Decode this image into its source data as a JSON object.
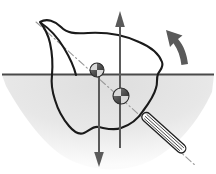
{
  "diagram": {
    "background_color": "#ffffff",
    "width": 216,
    "height": 174,
    "colors": {
      "hull_stroke": "#1a1a1a",
      "waterline_stroke": "#4a4a4a",
      "axis_stroke": "#9a9a9a",
      "force_arrow": "#5a5a5a",
      "water_fill": "#e8e8e8",
      "marker_dark": "#4f4f4f",
      "marker_light": "#d8d8d8",
      "rod_fill": "#fdfdfd",
      "rod_stroke": "#1f1f1f"
    },
    "elements": {
      "hull": {
        "name": "hull-cross-section",
        "description": "heeled ship hull cross-section outline with pointed bow at upper left and wavy keel bottom",
        "path": "M 40 22 C 46 18 54 20 60 26 C 66 32 72 33 86 32 C 104 31 122 34 138 41 C 150 46 158 53 161 61 C 163 66 160 70 158 74 C 156 78 157 82 156 87 C 154 95 149 102 143 110 C 137 118 129 124 120 127 C 112 130 104 128 97 127 C 92 126 88 130 83 132 C 78 134 73 131 68 125 C 62 118 57 109 54 99 C 51 90 50 82 51 74 C 52 63 52 52 50 43 C 48 34 44 27 40 22 Z"
      },
      "waterline": {
        "name": "waterline",
        "description": "horizontal free-surface line across full width",
        "y": 74,
        "x_start": 2,
        "x_end": 214
      },
      "water_region": {
        "name": "submerged-water-shading",
        "description": "light gray shaded region below the waterline tapering to a bowl shape",
        "fill": "#e8e8e8"
      },
      "inclined_axis": {
        "name": "inclination-axis-line",
        "description": "dash-dot centerline showing the heeled vertical axis of the vessel",
        "x1": 36,
        "y1": 22,
        "x2": 196,
        "y2": 166
      },
      "buoyancy_arrow": {
        "name": "buoyancy-force-arrow",
        "direction": "up",
        "description": "upward buoyancy force vector through the center of buoyancy",
        "x": 120,
        "y_tail": 148,
        "y_head": 12
      },
      "weight_arrow": {
        "name": "weight-force-arrow",
        "direction": "down",
        "description": "downward gravity force vector through the center of gravity",
        "x": 99,
        "y_tail": 70,
        "y_head": 166
      },
      "righting_moment_arrow": {
        "name": "righting-moment-curved-arrow",
        "direction": "counter-clockwise-up-left",
        "description": "curved arrow at upper right indicating the righting moment / rotation sense"
      },
      "center_of_gravity_marker": {
        "name": "center-of-gravity-marker",
        "description": "quadrant-shaded circle marker located above the waterline on the axis",
        "cx": 97,
        "cy": 70,
        "r": 7
      },
      "center_of_buoyancy_marker": {
        "name": "center-of-buoyancy-marker",
        "description": "quadrant-shaded circle marker located below the waterline on the axis",
        "cx": 121,
        "cy": 96,
        "r": 8
      },
      "keel_rod": {
        "name": "keel-rod",
        "description": "long slender hatched rod extending down-right from the hull along the inclined axis",
        "angle_degrees": 42
      }
    }
  }
}
